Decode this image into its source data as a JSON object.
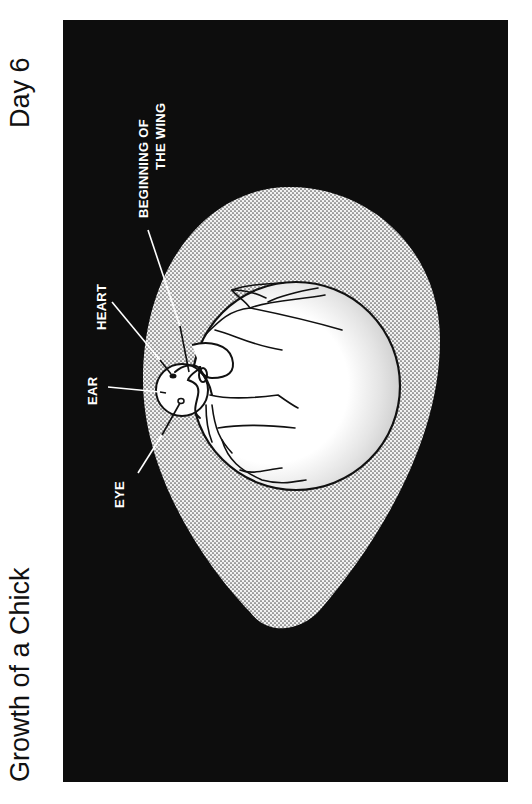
{
  "page": {
    "title": "Growth of a Chick",
    "subtitle": "Day 6"
  },
  "diagram": {
    "colors": {
      "background": "#0d0d0d",
      "egg_fill": "#e8e8e8",
      "yolk_fill": "#ffffff",
      "lines": "#111111",
      "label_text": "#ffffff"
    },
    "labels": {
      "wing_line1": "BEGINNING OF",
      "wing_line2": "THE WING",
      "heart": "HEART",
      "ear": "EAR",
      "eye": "EYE"
    }
  }
}
